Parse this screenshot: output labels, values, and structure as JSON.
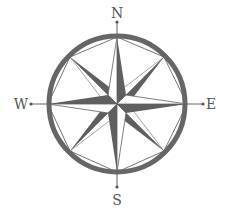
{
  "figure": {
    "directions": {
      "north": "N",
      "east": "E",
      "south": "S",
      "west": "W"
    },
    "points": 8,
    "colors": {
      "background": "#ffffff",
      "ring": "#666666",
      "dark_fill": "#5f5f5f",
      "light_fill": "#ffffff",
      "line": "#666666",
      "label": "#555555"
    }
  }
}
